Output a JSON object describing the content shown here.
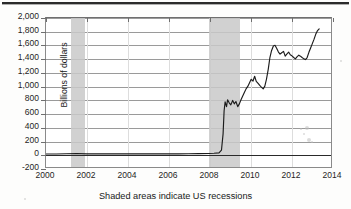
{
  "figure": {
    "caption": "Shaded areas indicate US recessions",
    "top_rule": true
  },
  "chart_data": {
    "type": "line",
    "title": "",
    "subtitle": "",
    "xlabel": "",
    "ylabel": "Billions of dollars",
    "annotation": "Shaded areas indicate US recessions",
    "grid": true,
    "legend": "none",
    "xlim": [
      2000,
      2014
    ],
    "ylim": [
      -200,
      2000
    ],
    "yticks": [
      -200,
      0,
      200,
      400,
      600,
      800,
      1000,
      1200,
      1400,
      1600,
      1800,
      2000
    ],
    "ytick_labels": [
      "-200",
      "0",
      "200",
      "400",
      "600",
      "800",
      "1,000",
      "1,200",
      "1,400",
      "1,600",
      "1,800",
      "2,000"
    ],
    "xticks": [
      2000,
      2002,
      2004,
      2006,
      2008,
      2010,
      2012,
      2014
    ],
    "xtick_labels": [
      "2000",
      "2002",
      "2004",
      "2006",
      "2008",
      "2010",
      "2012",
      "2014"
    ],
    "series": [
      {
        "name": "Billions of dollars",
        "color": "#1c1c1c",
        "x": [
          2000.0,
          2000.5,
          2001.0,
          2001.5,
          2002.0,
          2002.5,
          2003.0,
          2003.5,
          2004.0,
          2004.5,
          2005.0,
          2005.5,
          2006.0,
          2006.5,
          2007.0,
          2007.5,
          2008.0,
          2008.25,
          2008.5,
          2008.62,
          2008.7,
          2008.75,
          2008.8,
          2008.87,
          2008.92,
          2009.0,
          2009.08,
          2009.17,
          2009.25,
          2009.33,
          2009.42,
          2009.5,
          2009.58,
          2009.67,
          2009.75,
          2009.83,
          2009.92,
          2010.0,
          2010.08,
          2010.17,
          2010.25,
          2010.33,
          2010.42,
          2010.5,
          2010.58,
          2010.67,
          2010.75,
          2010.83,
          2010.92,
          2011.0,
          2011.08,
          2011.17,
          2011.25,
          2011.33,
          2011.42,
          2011.5,
          2011.58,
          2011.67,
          2011.75,
          2011.83,
          2011.92,
          2012.0,
          2012.08,
          2012.17,
          2012.25,
          2012.33,
          2012.42,
          2012.5,
          2012.58,
          2012.67,
          2012.75,
          2012.83,
          2012.92,
          2013.0,
          2013.08,
          2013.17,
          2013.25,
          2013.33,
          2013.42
        ],
        "y": [
          5,
          5,
          8,
          12,
          6,
          6,
          6,
          6,
          6,
          6,
          6,
          6,
          6,
          6,
          8,
          10,
          12,
          15,
          20,
          60,
          300,
          640,
          770,
          700,
          800,
          755,
          725,
          790,
          740,
          775,
          700,
          740,
          800,
          860,
          910,
          960,
          1000,
          1050,
          1100,
          1075,
          1145,
          1070,
          1040,
          1010,
          985,
          960,
          1000,
          1100,
          1250,
          1420,
          1520,
          1590,
          1600,
          1555,
          1500,
          1470,
          1490,
          1510,
          1440,
          1470,
          1500,
          1460,
          1445,
          1420,
          1400,
          1430,
          1455,
          1440,
          1420,
          1400,
          1390,
          1420,
          1500,
          1560,
          1620,
          1690,
          1760,
          1810,
          1840
        ]
      }
    ],
    "shaded_regions": [
      {
        "label": "US recession",
        "x_start": 2001.2,
        "x_end": 2001.9,
        "color": "#c9c9c9"
      },
      {
        "label": "US recession",
        "x_start": 2007.95,
        "x_end": 2009.45,
        "color": "#c9c9c9"
      }
    ]
  }
}
